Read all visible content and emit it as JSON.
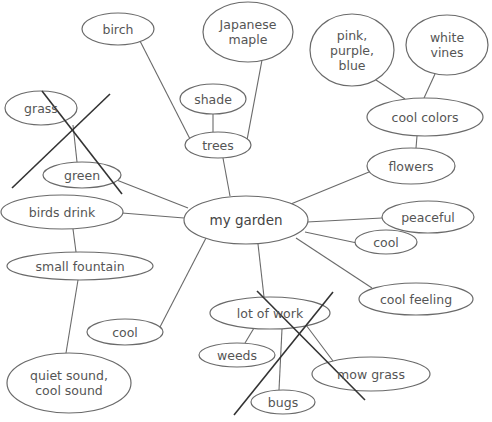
{
  "diagram": {
    "title": "my garden",
    "central_node": "my garden",
    "nodes": [
      {
        "id": "garden",
        "label": "my garden",
        "cx": 246,
        "cy": 220,
        "rx": 62,
        "ry": 24
      },
      {
        "id": "trees",
        "label": "trees",
        "cx": 218,
        "cy": 145,
        "rx": 33,
        "ry": 13
      },
      {
        "id": "birch",
        "label": "birch",
        "cx": 118,
        "cy": 29,
        "rx": 36,
        "ry": 16
      },
      {
        "id": "maple",
        "label": "Japanese\nmaple",
        "cx": 248,
        "cy": 32,
        "rx": 45,
        "ry": 30
      },
      {
        "id": "shade",
        "label": "shade",
        "cx": 213,
        "cy": 99,
        "rx": 33,
        "ry": 15
      },
      {
        "id": "flowers",
        "label": "flowers",
        "cx": 411,
        "cy": 166,
        "rx": 44,
        "ry": 18
      },
      {
        "id": "coolcolors",
        "label": "cool colors",
        "cx": 425,
        "cy": 117,
        "rx": 58,
        "ry": 19
      },
      {
        "id": "ppb",
        "label": "pink,\npurple,\nblue",
        "cx": 352,
        "cy": 50,
        "rx": 42,
        "ry": 36
      },
      {
        "id": "vines",
        "label": "white\nvines",
        "cx": 447,
        "cy": 45,
        "rx": 41,
        "ry": 30
      },
      {
        "id": "peaceful",
        "label": "peaceful",
        "cx": 428,
        "cy": 217,
        "rx": 46,
        "ry": 16
      },
      {
        "id": "cool_r",
        "label": "cool",
        "cx": 386,
        "cy": 242,
        "rx": 31,
        "ry": 12
      },
      {
        "id": "coolfeeling",
        "label": "cool feeling",
        "cx": 416,
        "cy": 299,
        "rx": 57,
        "ry": 16
      },
      {
        "id": "work",
        "label": "lot of work",
        "cx": 270,
        "cy": 313,
        "rx": 60,
        "ry": 16
      },
      {
        "id": "weeds",
        "label": "weeds",
        "cx": 237,
        "cy": 355,
        "rx": 38,
        "ry": 12
      },
      {
        "id": "mow",
        "label": "mow grass",
        "cx": 371,
        "cy": 374,
        "rx": 59,
        "ry": 17
      },
      {
        "id": "bugs",
        "label": "bugs",
        "cx": 283,
        "cy": 402,
        "rx": 32,
        "ry": 12
      },
      {
        "id": "cool_l",
        "label": "cool",
        "cx": 125,
        "cy": 332,
        "rx": 38,
        "ry": 13
      },
      {
        "id": "birds",
        "label": "birds drink",
        "cx": 62,
        "cy": 212,
        "rx": 61,
        "ry": 17
      },
      {
        "id": "fountain",
        "label": "small fountain",
        "cx": 80,
        "cy": 266,
        "rx": 73,
        "ry": 14
      },
      {
        "id": "quiet",
        "label": "quiet sound,\ncool sound",
        "cx": 69,
        "cy": 383,
        "rx": 62,
        "ry": 30
      },
      {
        "id": "green",
        "label": "green",
        "cx": 82,
        "cy": 175,
        "rx": 39,
        "ry": 13
      },
      {
        "id": "grass",
        "label": "grass",
        "cx": 41,
        "cy": 108,
        "rx": 36,
        "ry": 17
      }
    ],
    "edges": [
      {
        "x1": 230,
        "y1": 196,
        "x2": 223,
        "y2": 158
      },
      {
        "x1": 190,
        "y1": 139,
        "x2": 140,
        "y2": 41
      },
      {
        "x1": 247,
        "y1": 140,
        "x2": 262,
        "y2": 60
      },
      {
        "x1": 213,
        "y1": 114,
        "x2": 213,
        "y2": 132
      },
      {
        "x1": 286,
        "y1": 206,
        "x2": 369,
        "y2": 172
      },
      {
        "x1": 416,
        "y1": 148,
        "x2": 417,
        "y2": 136
      },
      {
        "x1": 405,
        "y1": 99,
        "x2": 376,
        "y2": 80
      },
      {
        "x1": 424,
        "y1": 98,
        "x2": 435,
        "y2": 74
      },
      {
        "x1": 307,
        "y1": 222,
        "x2": 382,
        "y2": 218
      },
      {
        "x1": 305,
        "y1": 232,
        "x2": 357,
        "y2": 243
      },
      {
        "x1": 296,
        "y1": 238,
        "x2": 372,
        "y2": 288
      },
      {
        "x1": 258,
        "y1": 244,
        "x2": 264,
        "y2": 297
      },
      {
        "x1": 206,
        "y1": 238,
        "x2": 160,
        "y2": 327
      },
      {
        "x1": 184,
        "y1": 218,
        "x2": 122,
        "y2": 213
      },
      {
        "x1": 188,
        "y1": 208,
        "x2": 114,
        "y2": 179
      },
      {
        "x1": 73,
        "y1": 229,
        "x2": 76,
        "y2": 252
      },
      {
        "x1": 78,
        "y1": 280,
        "x2": 66,
        "y2": 353
      },
      {
        "x1": 73,
        "y1": 125,
        "x2": 77,
        "y2": 162
      },
      {
        "x1": 254,
        "y1": 328,
        "x2": 245,
        "y2": 343
      },
      {
        "x1": 282,
        "y1": 329,
        "x2": 279,
        "y2": 390
      },
      {
        "x1": 306,
        "y1": 325,
        "x2": 333,
        "y2": 361
      }
    ],
    "crossouts": [
      {
        "x1": 42,
        "y1": 91,
        "x2": 122,
        "y2": 194
      },
      {
        "x1": 110,
        "y1": 94,
        "x2": 12,
        "y2": 188
      },
      {
        "x1": 257,
        "y1": 291,
        "x2": 365,
        "y2": 400
      },
      {
        "x1": 333,
        "y1": 292,
        "x2": 234,
        "y2": 415
      }
    ],
    "crossed_out_nodes": [
      "grass",
      "lot of work"
    ]
  }
}
